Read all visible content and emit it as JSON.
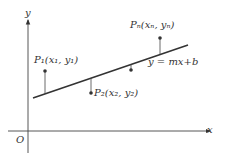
{
  "diagram": {
    "axis_x_label": "x",
    "axis_y_label": "y",
    "origin_label": "O",
    "line_equation": "y = mx+b",
    "points": [
      {
        "name": "P1",
        "label": "P₁(x₁, y₁)"
      },
      {
        "name": "P2",
        "label": "P₂(x₂, y₂)"
      },
      {
        "name": "P3",
        "label": ""
      },
      {
        "name": "Pn",
        "label": "Pₙ(xₙ, yₙ)"
      }
    ],
    "colors": {
      "stroke": "#333333",
      "background": "#ffffff"
    }
  }
}
